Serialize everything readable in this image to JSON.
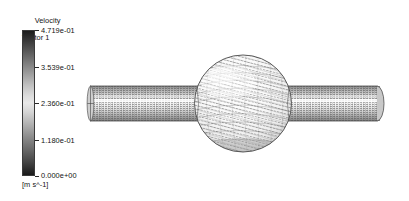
{
  "background_color": "#ffffff",
  "legend": {
    "title_line1": "Velocity",
    "title_line2": "Vector 1",
    "units": "[m s^-1]",
    "colormap": "grayscale",
    "colorbar_top_color": "#1c1c1c",
    "colorbar_mid_color": "#e8e8e8",
    "colorbar_bottom_color": "#1a1a1a",
    "ticks": [
      {
        "label": "4.719e-01",
        "value": 0.4719,
        "pos": 0.0
      },
      {
        "label": "3.539e-01",
        "value": 0.3539,
        "pos": 0.25
      },
      {
        "label": "2.360e-01",
        "value": 0.236,
        "pos": 0.5
      },
      {
        "label": "1.180e-01",
        "value": 0.118,
        "pos": 0.75
      },
      {
        "label": "0.000e+00",
        "value": 0.0,
        "pos": 1.0
      }
    ],
    "min_value": 0.0,
    "max_value": 0.4719
  },
  "scene": {
    "description": "CFD velocity vector plot of flow through a horizontal pipe with a spherical bulb",
    "geometry": [
      {
        "name": "inlet-pipe",
        "shape": "cylinder",
        "orientation": "horizontal"
      },
      {
        "name": "spherical-bulb",
        "shape": "sphere"
      },
      {
        "name": "outlet-pipe",
        "shape": "cylinder",
        "orientation": "horizontal"
      }
    ],
    "vector_field": "dense arrow glyphs covering pipe and sphere surfaces"
  }
}
